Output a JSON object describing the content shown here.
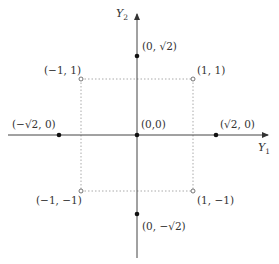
{
  "diagram": {
    "type": "coordinate-plane",
    "colors": {
      "axis": "#444444",
      "dotted": "#aaaaaa",
      "filled_point": "#111111",
      "open_point_stroke": "#666666",
      "text": "#333333"
    },
    "axes": {
      "x_label": "Y",
      "x_label_sub": "1",
      "y_label": "Y",
      "y_label_sub": "2"
    },
    "points": [
      {
        "id": "top",
        "label": "(0, √2)",
        "x": 0,
        "y": 1.414,
        "style": "filled"
      },
      {
        "id": "bottom",
        "label": "(0, −√2)",
        "x": 0,
        "y": -1.414,
        "style": "filled"
      },
      {
        "id": "left",
        "label": "(−√2, 0)",
        "x": -1.414,
        "y": 0,
        "style": "filled"
      },
      {
        "id": "right",
        "label": "(√2, 0)",
        "x": 1.414,
        "y": 0,
        "style": "filled"
      },
      {
        "id": "origin",
        "label": "(0,0)",
        "x": 0,
        "y": 0,
        "style": "filled"
      },
      {
        "id": "tl",
        "label": "(−1, 1)",
        "x": -1,
        "y": 1,
        "style": "open"
      },
      {
        "id": "tr",
        "label": "(1, 1)",
        "x": 1,
        "y": 1,
        "style": "open"
      },
      {
        "id": "bl",
        "label": "(−1, −1)",
        "x": -1,
        "y": -1,
        "style": "open"
      },
      {
        "id": "br",
        "label": "(1, −1)",
        "x": 1,
        "y": -1,
        "style": "open"
      }
    ],
    "dotted_square": {
      "x_min": -1,
      "x_max": 1,
      "y_min": -1,
      "y_max": 1
    }
  }
}
